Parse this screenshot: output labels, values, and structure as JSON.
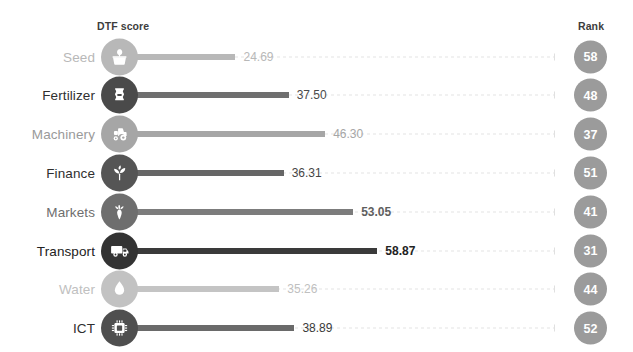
{
  "header": {
    "score_label": "DTF score",
    "rank_label": "Rank"
  },
  "colors": {
    "background": "#ffffff",
    "track": "#e4e4e4",
    "rank_badge": "#9b9b9b",
    "rank_text": "#ffffff",
    "header_text": "#3d3d3d",
    "tone_light": "#b8b8b8",
    "tone_mid_light": "#a0a0a0",
    "tone_mid": "#7a7a7a",
    "tone_dark": "#5a5a5a",
    "tone_darkest": "#3a3a3a"
  },
  "chart_data": {
    "type": "bar",
    "title": "",
    "subtitle": "",
    "xlabel": "DTF score",
    "ylabel": "",
    "orientation": "horizontal",
    "grid": false,
    "legend": false,
    "xlim": [
      0,
      100
    ],
    "categories": [
      "Seed",
      "Fertilizer",
      "Machinery",
      "Finance",
      "Markets",
      "Transport",
      "Water",
      "ICT"
    ],
    "values": [
      24.69,
      37.5,
      46.3,
      36.31,
      53.05,
      58.87,
      35.26,
      38.89
    ],
    "value_labels": [
      "24.69",
      "37.50",
      "46.30",
      "36.31",
      "53.05",
      "58.87",
      "35.26",
      "38.89"
    ],
    "ranks": [
      58,
      48,
      37,
      51,
      41,
      31,
      44,
      52
    ],
    "rank_labels": [
      "58",
      "48",
      "37",
      "51",
      "41",
      "31",
      "44",
      "52"
    ],
    "series": [
      {
        "name": "DTF score",
        "values": [
          24.69,
          37.5,
          46.3,
          36.31,
          53.05,
          58.87,
          35.26,
          38.89
        ]
      },
      {
        "name": "Rank",
        "values": [
          58,
          48,
          37,
          51,
          41,
          31,
          44,
          52
        ]
      }
    ]
  },
  "rows": [
    {
      "label": "Seed",
      "icon": "seed-basket-icon",
      "value": 24.69,
      "value_label": "24.69",
      "rank_label": "58",
      "bar_color": "#b8b8b8",
      "icon_color": "#b8b8b8",
      "label_color": "#b8b8b8",
      "value_color": "#b8b8b8"
    },
    {
      "label": "Fertilizer",
      "icon": "fertilizer-bag-icon",
      "value": 37.5,
      "value_label": "37.50",
      "rank_label": "48",
      "bar_color": "#6f6f6f",
      "icon_color": "#4a4a4a",
      "label_color": "#2f2f2f",
      "value_color": "#4a4a4a"
    },
    {
      "label": "Machinery",
      "icon": "tractor-icon",
      "value": 46.3,
      "value_label": "46.30",
      "rank_label": "37",
      "bar_color": "#a6a6a6",
      "icon_color": "#a6a6a6",
      "label_color": "#9a9a9a",
      "value_color": "#a6a6a6"
    },
    {
      "label": "Finance",
      "icon": "sprout-coin-icon",
      "value": 36.31,
      "value_label": "36.31",
      "rank_label": "51",
      "bar_color": "#666666",
      "icon_color": "#555555",
      "label_color": "#2f2f2f",
      "value_color": "#444444"
    },
    {
      "label": "Markets",
      "icon": "carrot-icon",
      "value": 53.05,
      "value_label": "53.05",
      "rank_label": "41",
      "bar_color": "#7c7c7c",
      "icon_color": "#6e6e6e",
      "label_color": "#6e6e6e",
      "value_color": "#5e5e5e"
    },
    {
      "label": "Transport",
      "icon": "truck-icon",
      "value": 58.87,
      "value_label": "58.87",
      "rank_label": "31",
      "bar_color": "#3a3a3a",
      "icon_color": "#333333",
      "label_color": "#222222",
      "value_color": "#222222"
    },
    {
      "label": "Water",
      "icon": "water-drop-icon",
      "value": 35.26,
      "value_label": "35.26",
      "rank_label": "44",
      "bar_color": "#c4c4c4",
      "icon_color": "#c2c2c2",
      "label_color": "#c0c0c0",
      "value_color": "#c0c0c0"
    },
    {
      "label": "ICT",
      "icon": "microchip-icon",
      "value": 38.89,
      "value_label": "38.89",
      "rank_label": "52",
      "bar_color": "#6a6a6a",
      "icon_color": "#4f4f4f",
      "label_color": "#2f2f2f",
      "value_color": "#3a3a3a"
    }
  ]
}
